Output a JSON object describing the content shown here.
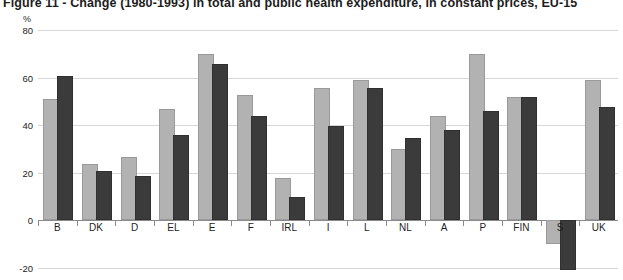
{
  "chart_data": {
    "type": "bar",
    "title": "Figure 11 - Change (1980-1993) in total and public health expenditure, in constant prices, EU-15",
    "xlabel": "",
    "ylabel": "%",
    "ylim": [
      -20,
      80
    ],
    "yticks": [
      80,
      60,
      40,
      20,
      0,
      -20
    ],
    "grid": true,
    "legend": "none",
    "categories": [
      "B",
      "DK",
      "D",
      "EL",
      "E",
      "F",
      "IRL",
      "I",
      "L",
      "NL",
      "A",
      "P",
      "FIN",
      "S",
      "UK"
    ],
    "series": [
      {
        "name": "Total health expenditure",
        "color": "#b2b2b2",
        "values": [
          50,
          23,
          26,
          46,
          69,
          52,
          17,
          55,
          58,
          29,
          43,
          69,
          51,
          -9,
          58
        ]
      },
      {
        "name": "Public health expenditure",
        "color": "#3b3b3b",
        "values": [
          60,
          20,
          18,
          35,
          65,
          43,
          9,
          39,
          55,
          34,
          37,
          45,
          51,
          -20,
          47
        ]
      }
    ]
  },
  "axis": {
    "unit_label": "%",
    "tick_labels": [
      "80",
      "60",
      "40",
      "20",
      "0",
      "-20"
    ]
  }
}
